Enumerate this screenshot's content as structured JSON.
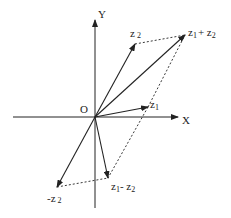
{
  "diagram": {
    "labels": {
      "y_axis": "Y",
      "x_axis": "X",
      "origin": "O",
      "z1": "z",
      "z1_sub": "1",
      "z2": "z",
      "z2_sub": "2",
      "sum_a": "z",
      "sum_a_sub": "1",
      "sum_plus": "+ z",
      "sum_b_sub": "2",
      "neg_z2": "-z",
      "neg_z2_sub": "2",
      "diff_a": "z",
      "diff_a_sub": "1",
      "diff_minus": "- z",
      "diff_b_sub": "2"
    },
    "points": {
      "origin": [
        95,
        117
      ],
      "z1": [
        148,
        107
      ],
      "z2": [
        135,
        44
      ],
      "z1_plus_z2": [
        185,
        35
      ],
      "neg_z2": [
        57,
        187
      ],
      "z1_minus_z2": [
        108,
        178
      ]
    },
    "colors": {
      "line": "#222222"
    }
  }
}
